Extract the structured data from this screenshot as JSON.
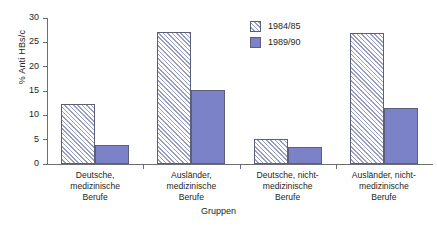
{
  "chart_data": {
    "type": "bar",
    "title": "",
    "xlabel": "Gruppen",
    "ylabel": "% Anti HBs/c",
    "ylim": [
      0,
      30
    ],
    "yticks": [
      0,
      5,
      10,
      15,
      20,
      25,
      30
    ],
    "grid": false,
    "legend_position": "top-right",
    "categories": [
      "Deutsche, medizinische Berufe",
      "Ausländer, medizinische Berufe",
      "Deutsche, nicht-medizinische Berufe",
      "Ausländer, nicht-medizinische Berufe"
    ],
    "category_lines": [
      [
        "Deutsche,",
        "medizinische",
        "Berufe"
      ],
      [
        "Ausländer,",
        "medizinische",
        "Berufe"
      ],
      [
        "Deutsche, nicht-",
        "medizinische",
        "Berufe"
      ],
      [
        "Ausländer, nicht-",
        "medizinische",
        "Berufe"
      ]
    ],
    "series": [
      {
        "name": "1984/85",
        "color": "#f2f2f7",
        "pattern": "hatched",
        "values": [
          12.3,
          27.1,
          5.2,
          26.9
        ]
      },
      {
        "name": "1989/90",
        "color": "#7b82c8",
        "pattern": "solid",
        "values": [
          3.9,
          15.3,
          3.5,
          11.5
        ]
      }
    ]
  },
  "legend": {
    "items": [
      {
        "label": "1984/85"
      },
      {
        "label": "1989/90"
      }
    ]
  },
  "axis": {
    "y_title": "% Anti HBs/c",
    "x_title": "Gruppen",
    "y_tick_labels": [
      "0",
      "5",
      "10",
      "15",
      "20",
      "25",
      "30"
    ]
  }
}
